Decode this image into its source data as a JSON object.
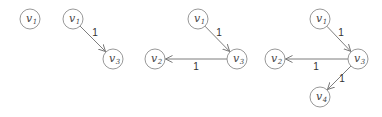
{
  "diagram": {
    "colors": {
      "node_stroke": "#8c8c8c",
      "edge": "#6e6e6e",
      "text": "#333333"
    },
    "panels": [
      {
        "id": "step1",
        "nodes": [
          {
            "id": "v1",
            "base": "v",
            "sub": "1",
            "x": 30,
            "y": 19
          }
        ],
        "edges": []
      },
      {
        "id": "step2",
        "nodes": [
          {
            "id": "v1",
            "base": "v",
            "sub": "1",
            "x": 73,
            "y": 19
          },
          {
            "id": "v3",
            "base": "v",
            "sub": "3",
            "x": 113,
            "y": 59
          }
        ],
        "edges": [
          {
            "from": "v1",
            "to": "v3",
            "weight": "1",
            "lx": 95,
            "ly": 36
          }
        ]
      },
      {
        "id": "step3",
        "nodes": [
          {
            "id": "v1",
            "base": "v",
            "sub": "1",
            "x": 198,
            "y": 19
          },
          {
            "id": "v3",
            "base": "v",
            "sub": "3",
            "x": 237,
            "y": 59
          },
          {
            "id": "v2",
            "base": "v",
            "sub": "2",
            "x": 155,
            "y": 59
          }
        ],
        "edges": [
          {
            "from": "v1",
            "to": "v3",
            "weight": "1",
            "lx": 219,
            "ly": 36
          },
          {
            "from": "v3",
            "to": "v2",
            "weight": "1",
            "lx": 196,
            "ly": 70
          }
        ]
      },
      {
        "id": "step4",
        "nodes": [
          {
            "id": "v1",
            "base": "v",
            "sub": "1",
            "x": 320,
            "y": 19
          },
          {
            "id": "v3",
            "base": "v",
            "sub": "3",
            "x": 358,
            "y": 59
          },
          {
            "id": "v2",
            "base": "v",
            "sub": "2",
            "x": 275,
            "y": 59
          },
          {
            "id": "v4",
            "base": "v",
            "sub": "4",
            "x": 320,
            "y": 97
          }
        ],
        "edges": [
          {
            "from": "v1",
            "to": "v3",
            "weight": "1",
            "lx": 341,
            "ly": 36
          },
          {
            "from": "v3",
            "to": "v2",
            "weight": "1",
            "lx": 316,
            "ly": 70
          },
          {
            "from": "v3",
            "to": "v4",
            "weight": "1",
            "lx": 342,
            "ly": 82
          }
        ]
      }
    ]
  }
}
